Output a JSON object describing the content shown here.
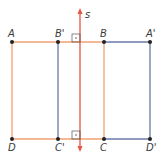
{
  "diagram": {
    "type": "reflection",
    "axis": {
      "label": "s",
      "color": "#e8553e"
    },
    "original": {
      "name": "ABCD",
      "color": "#f0a070",
      "vertices": [
        {
          "label": "A",
          "x": 12,
          "y": 42
        },
        {
          "label": "B",
          "x": 104,
          "y": 42
        },
        {
          "label": "C",
          "x": 104,
          "y": 139
        },
        {
          "label": "D",
          "x": 12,
          "y": 139
        }
      ]
    },
    "image": {
      "name": "A'B'C'D'",
      "color": "#6a78a8",
      "vertices": [
        {
          "label": "A'",
          "x": 150,
          "y": 42
        },
        {
          "label": "B'",
          "x": 58,
          "y": 42
        },
        {
          "label": "C'",
          "x": 58,
          "y": 139
        },
        {
          "label": "D'",
          "x": 150,
          "y": 139
        }
      ]
    },
    "labels": {
      "A": "A",
      "B": "B",
      "C": "C",
      "D": "D",
      "A_prime": "A'",
      "B_prime": "B'",
      "C_prime": "C'",
      "D_prime": "D'",
      "axis": "s"
    }
  }
}
